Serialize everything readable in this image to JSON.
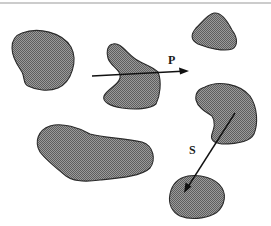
{
  "figure": {
    "colors": {
      "blob_fill": "#8a8a8a",
      "blob_stipple_dark": "#5e5e5e",
      "blob_stroke": "#2b2b2b",
      "arrow": "#111111",
      "background": "#ffffff",
      "top_rule": "#9a9a9a"
    },
    "blobs": [
      {
        "id": "blob-top-left",
        "shape": "bean"
      },
      {
        "id": "blob-center",
        "shape": "irregular-crescent",
        "crossed_by": "P"
      },
      {
        "id": "blob-top-right",
        "shape": "rounded-triangle"
      },
      {
        "id": "blob-right-middle",
        "shape": "bean",
        "contains_start_of": "S"
      },
      {
        "id": "blob-bottom-left",
        "shape": "elongated"
      },
      {
        "id": "blob-bottom-right",
        "shape": "rounded",
        "contains_end_of": "S"
      }
    ],
    "arrows": [
      {
        "label": "P",
        "from": [
          92,
          76
        ],
        "to": [
          188,
          71
        ]
      },
      {
        "label": "S",
        "from": [
          235,
          113
        ],
        "to": [
          184,
          193
        ]
      }
    ]
  },
  "labels": {
    "p": "P",
    "s": "S"
  }
}
